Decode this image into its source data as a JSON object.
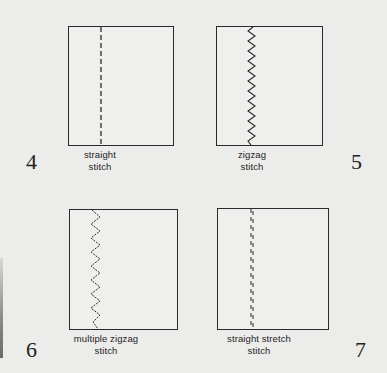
{
  "figures": [
    {
      "number": "4",
      "caption_line1": "straight",
      "caption_line2": "stitch",
      "stitch_type": "straight-dashed"
    },
    {
      "number": "5",
      "caption_line1": "zigzag",
      "caption_line2": "stitch",
      "stitch_type": "zigzag"
    },
    {
      "number": "6",
      "caption_line1": "multiple zigzag",
      "caption_line2": "stitch",
      "stitch_type": "multiple-zigzag"
    },
    {
      "number": "7",
      "caption_line1": "straight stretch",
      "caption_line2": "stitch",
      "stitch_type": "straight-stretch"
    }
  ],
  "colors": {
    "paper": "#ececea",
    "ink": "#2a2a2a"
  }
}
